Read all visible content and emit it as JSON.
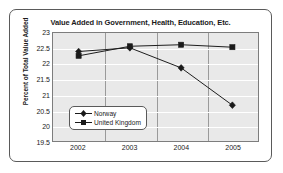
{
  "chart_data": {
    "type": "line",
    "title": "Value Added in Government, Health, Education, Etc.",
    "xlabel": "",
    "ylabel": "Percent of Total Value Added",
    "categories": [
      "2002",
      "2003",
      "2004",
      "2005"
    ],
    "ylim": [
      19.5,
      23
    ],
    "yticks": [
      23,
      22.5,
      22,
      21.5,
      21,
      20.5,
      20,
      19.5
    ],
    "ytick_labels": [
      "23",
      "22.5",
      "22",
      "21.5",
      "21",
      "20.5",
      "20",
      "19.5"
    ],
    "grid": true,
    "legend_position": "center-left",
    "series": [
      {
        "name": "Norway",
        "marker": "diamond",
        "values": [
          22.4,
          22.52,
          21.87,
          20.66
        ]
      },
      {
        "name": "United Kingdom",
        "marker": "square",
        "values": [
          22.26,
          22.57,
          22.62,
          22.54
        ]
      }
    ]
  },
  "colors": {
    "line": "#1a1a1a",
    "plot_background": "#e9e9e9",
    "gridline": "#ffffff",
    "vertical_gridline": "#9a9a9a",
    "frame_border": "#5a5a5a",
    "text": "#1a1a1a"
  }
}
